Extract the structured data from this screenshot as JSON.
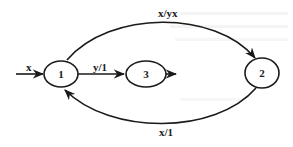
{
  "diagram": {
    "type": "state-transition",
    "nodes": [
      {
        "id": "1",
        "label": "1"
      },
      {
        "id": "3",
        "label": "3"
      },
      {
        "id": "2",
        "label": "2"
      }
    ],
    "edges": [
      {
        "from": "input",
        "to": "1",
        "label": "x"
      },
      {
        "from": "1",
        "to": "3",
        "label": "y/1"
      },
      {
        "from": "3",
        "to": "output",
        "label": ""
      },
      {
        "from": "1",
        "to": "2",
        "label": "x/yx"
      },
      {
        "from": "2",
        "to": "1",
        "label": "x/1"
      }
    ],
    "colors": {
      "ink": "#1a1a1a",
      "background": "#ffffff"
    }
  }
}
